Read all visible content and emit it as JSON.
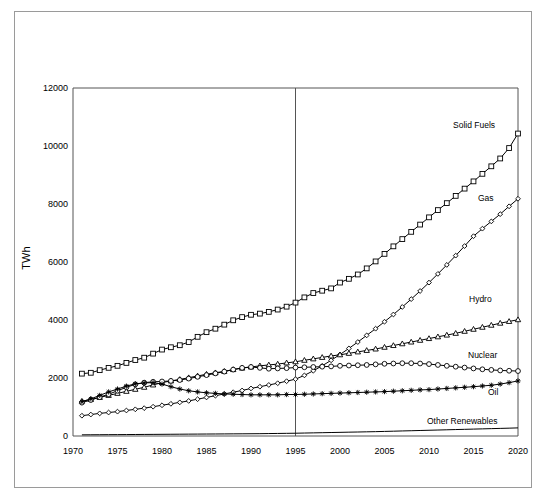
{
  "chart_data": {
    "type": "line",
    "title": "",
    "subtitle": "",
    "xlabel": "",
    "ylabel": "TWh",
    "xlim": [
      1970,
      2020
    ],
    "ylim": [
      0,
      12000
    ],
    "grid": false,
    "legend_position": "inline-right",
    "x_ticks": [
      "1970",
      "1975",
      "1980",
      "1985",
      "1990",
      "1995",
      "2000",
      "2005",
      "2010",
      "2015",
      "2020"
    ],
    "y_ticks": [
      "0",
      "2000",
      "4000",
      "6000",
      "8000",
      "10000",
      "12000"
    ],
    "annotations": [
      {
        "name": "projection-divider",
        "type": "vline",
        "x": 1995
      }
    ],
    "x": [
      1971,
      1972,
      1973,
      1974,
      1975,
      1976,
      1977,
      1978,
      1979,
      1980,
      1981,
      1982,
      1983,
      1984,
      1985,
      1986,
      1987,
      1988,
      1989,
      1990,
      1991,
      1992,
      1993,
      1994,
      1995,
      1996,
      1997,
      1998,
      1999,
      2000,
      2001,
      2002,
      2003,
      2004,
      2005,
      2006,
      2007,
      2008,
      2009,
      2010,
      2011,
      2012,
      2013,
      2014,
      2015,
      2016,
      2017,
      2018,
      2019,
      2020
    ],
    "series": [
      {
        "name": "Solid Fuels",
        "marker": "square",
        "values": [
          2150,
          2180,
          2270,
          2350,
          2420,
          2520,
          2620,
          2700,
          2840,
          2980,
          3060,
          3130,
          3240,
          3420,
          3580,
          3700,
          3840,
          3990,
          4100,
          4180,
          4220,
          4280,
          4360,
          4460,
          4600,
          4780,
          4930,
          5010,
          5090,
          5290,
          5420,
          5570,
          5780,
          6020,
          6280,
          6540,
          6790,
          7040,
          7290,
          7540,
          7790,
          8030,
          8280,
          8530,
          8780,
          9040,
          9300,
          9570,
          9930,
          10430
        ]
      },
      {
        "name": "Gas",
        "marker": "diamond",
        "values": [
          700,
          740,
          780,
          810,
          840,
          880,
          920,
          960,
          1010,
          1060,
          1110,
          1160,
          1210,
          1270,
          1330,
          1390,
          1450,
          1510,
          1570,
          1640,
          1700,
          1760,
          1820,
          1890,
          1960,
          2090,
          2250,
          2420,
          2610,
          2810,
          3020,
          3240,
          3470,
          3700,
          3940,
          4190,
          4450,
          4720,
          5000,
          5290,
          5590,
          5900,
          6220,
          6550,
          6890,
          7150,
          7400,
          7650,
          7920,
          8180
        ]
      },
      {
        "name": "Hydro",
        "marker": "triangle",
        "values": [
          1200,
          1260,
          1330,
          1400,
          1470,
          1540,
          1610,
          1680,
          1760,
          1840,
          1900,
          1950,
          2010,
          2070,
          2130,
          2180,
          2230,
          2290,
          2340,
          2380,
          2420,
          2450,
          2480,
          2520,
          2560,
          2610,
          2660,
          2710,
          2760,
          2800,
          2850,
          2900,
          2950,
          3000,
          3060,
          3120,
          3180,
          3240,
          3300,
          3360,
          3420,
          3480,
          3540,
          3610,
          3680,
          3750,
          3820,
          3890,
          3950,
          4010
        ]
      },
      {
        "name": "Nuclear",
        "marker": "circle",
        "values": [
          1150,
          1240,
          1340,
          1440,
          1560,
          1680,
          1780,
          1840,
          1870,
          1880,
          1900,
          1930,
          1980,
          2040,
          2100,
          2160,
          2220,
          2290,
          2350,
          2380,
          2350,
          2320,
          2330,
          2340,
          2360,
          2370,
          2380,
          2390,
          2400,
          2420,
          2430,
          2440,
          2450,
          2470,
          2490,
          2500,
          2510,
          2510,
          2500,
          2480,
          2450,
          2420,
          2390,
          2360,
          2330,
          2300,
          2280,
          2260,
          2250,
          2240
        ]
      },
      {
        "name": "Oil",
        "marker": "star",
        "values": [
          1180,
          1280,
          1400,
          1520,
          1620,
          1720,
          1800,
          1830,
          1840,
          1790,
          1700,
          1620,
          1560,
          1520,
          1490,
          1470,
          1450,
          1440,
          1430,
          1420,
          1420,
          1420,
          1420,
          1430,
          1430,
          1440,
          1450,
          1460,
          1470,
          1480,
          1490,
          1500,
          1510,
          1520,
          1530,
          1545,
          1560,
          1575,
          1590,
          1600,
          1620,
          1640,
          1660,
          1680,
          1700,
          1725,
          1750,
          1790,
          1840,
          1900
        ]
      },
      {
        "name": "Other Renewables",
        "marker": "none",
        "values": [
          40,
          42,
          44,
          46,
          48,
          50,
          52,
          54,
          56,
          58,
          60,
          62,
          64,
          66,
          68,
          70,
          72,
          74,
          76,
          78,
          80,
          84,
          88,
          92,
          96,
          102,
          108,
          114,
          120,
          126,
          132,
          138,
          144,
          150,
          158,
          166,
          174,
          182,
          190,
          198,
          206,
          214,
          222,
          230,
          238,
          246,
          254,
          262,
          270,
          280
        ]
      }
    ],
    "series_label_positions": [
      {
        "name": "Solid Fuels",
        "x": 453,
        "y": 128,
        "anchor": "start"
      },
      {
        "name": "Gas",
        "x": 478,
        "y": 201,
        "anchor": "start"
      },
      {
        "name": "Hydro",
        "x": 469,
        "y": 302,
        "anchor": "start"
      },
      {
        "name": "Nuclear",
        "x": 468,
        "y": 358,
        "anchor": "start"
      },
      {
        "name": "Oil",
        "x": 488,
        "y": 395,
        "anchor": "start"
      },
      {
        "name": "Other Renewables",
        "x": 427,
        "y": 424,
        "anchor": "start"
      }
    ]
  }
}
